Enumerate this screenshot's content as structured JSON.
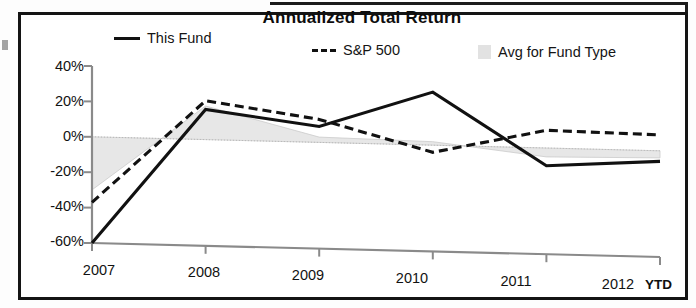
{
  "chart_data": {
    "type": "line",
    "title": "Annualized Total Return",
    "xlabel": "",
    "ylabel": "",
    "x": [
      "2007",
      "2008",
      "2009",
      "2010",
      "2011",
      "2012"
    ],
    "categories": [
      "2007",
      "2008",
      "2009",
      "2010",
      "2011",
      "2012"
    ],
    "x_axis_suffix": "YTD",
    "ytick_labels": [
      "40%",
      "20%",
      "0%",
      "-20%",
      "-40%",
      "-60%"
    ],
    "ytick_values": [
      40,
      20,
      0,
      -20,
      -40,
      -60
    ],
    "ylim": [
      -60,
      40
    ],
    "grid": false,
    "legend_position": "top",
    "series": [
      {
        "name": "This Fund",
        "style": "solid",
        "color": "#111111",
        "values": [
          -60,
          17,
          9,
          30,
          -10,
          -6
        ]
      },
      {
        "name": "S&P 500",
        "style": "dashed",
        "color": "#111111",
        "values": [
          -37,
          22,
          13,
          -4,
          10,
          9
        ]
      },
      {
        "name": "Avg for Fund Type",
        "style": "area",
        "color": "#e2e2e2",
        "values": [
          -30,
          19,
          3,
          2,
          -5,
          -4
        ]
      }
    ]
  },
  "chart": {
    "title": "Annualized Total Return",
    "legend": [
      {
        "label": "This Fund",
        "swatch": "solid-line-swatch"
      },
      {
        "label": "S&P 500",
        "swatch": "dashed-line-swatch"
      },
      {
        "label": "Avg for Fund Type",
        "swatch": "gray-box-swatch"
      }
    ],
    "y_axis": {
      "ticks": [
        "40%",
        "20%",
        "0%",
        "-20%",
        "-40%",
        "-60%"
      ]
    },
    "x_axis": {
      "ticks": [
        "2007",
        "2008",
        "2009",
        "2010",
        "2011",
        "2012"
      ],
      "suffix": "YTD"
    }
  }
}
